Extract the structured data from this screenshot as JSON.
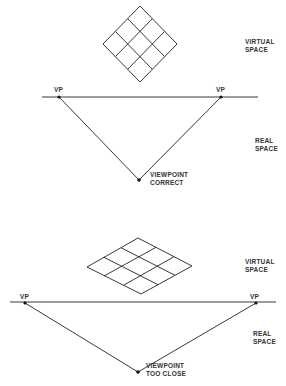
{
  "diagram": {
    "panels": [
      {
        "name": "viewpoint-correct",
        "labels": {
          "virtual_space": [
            "VIRTUAL",
            "SPACE"
          ],
          "real_space": [
            "REAL",
            "SPACE"
          ],
          "vp_left": "VP",
          "vp_right": "VP",
          "viewpoint": [
            "VIEWPOINT",
            "CORRECT"
          ]
        }
      },
      {
        "name": "viewpoint-too-close",
        "labels": {
          "virtual_space": [
            "VIRTUAL",
            "SPACE"
          ],
          "real_space": [
            "REAL",
            "SPACE"
          ],
          "vp_left": "VP",
          "vp_right": "VP",
          "viewpoint": [
            "VIEWPOINT",
            "TOO CLOSE"
          ]
        }
      }
    ],
    "colors": {
      "line": "#222222",
      "text": "#333333",
      "background": "#ffffff"
    }
  }
}
